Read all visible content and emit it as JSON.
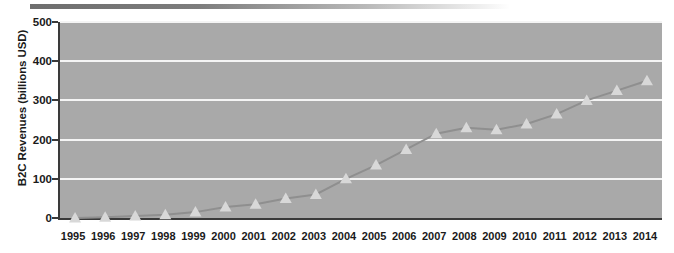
{
  "decor": {
    "top_bar_name": "top-gradient-bar",
    "bar_color_dark": "#6e6e6e",
    "bar_color_light": "#ffffff"
  },
  "style": {
    "plot_background": "#a9a9a9",
    "gridline_color": "#f4f4f4",
    "axis_color": "#3a3a3a",
    "series_line_color": "#8f8f8f",
    "marker_color": "#d8d8d8",
    "text_color": "#1a1a1a"
  },
  "chart_data": {
    "type": "line",
    "title": "",
    "xlabel": "",
    "ylabel": "B2C Revenues (billions USD)",
    "ylim": [
      0,
      500
    ],
    "yticks": [
      0,
      100,
      200,
      300,
      400,
      500
    ],
    "ytick_labels": [
      "0",
      "100",
      "200",
      "300",
      "400",
      "500"
    ],
    "grid": true,
    "legend": false,
    "marker": "triangle",
    "categories": [
      "1995",
      "1996",
      "1997",
      "1998",
      "1999",
      "2000",
      "2001",
      "2002",
      "2003",
      "2004",
      "2005",
      "2006",
      "2007",
      "2008",
      "2009",
      "2010",
      "2011",
      "2012",
      "2013",
      "2014"
    ],
    "values": [
      0,
      2,
      5,
      8,
      15,
      28,
      35,
      50,
      60,
      100,
      135,
      175,
      215,
      230,
      225,
      240,
      265,
      300,
      325,
      350
    ],
    "series": [
      {
        "name": "B2C Revenues",
        "values": [
          0,
          2,
          5,
          8,
          15,
          28,
          35,
          50,
          60,
          100,
          135,
          175,
          215,
          230,
          225,
          240,
          265,
          300,
          325,
          350
        ]
      }
    ]
  }
}
